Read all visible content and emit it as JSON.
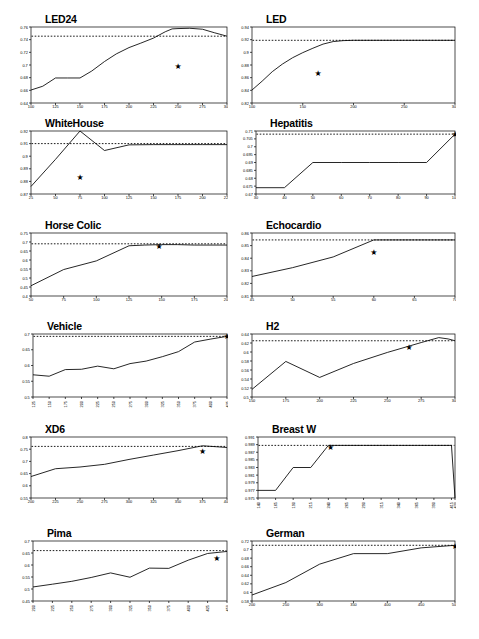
{
  "figure": {
    "name": "learning-curves-figure",
    "panel_count": 12,
    "line_color": "#000000",
    "reference_color": "#000000",
    "marker_symbol": "★",
    "background": "#ffffff"
  },
  "chart_data": [
    {
      "type": "line",
      "title": "LED24",
      "xlabel": "",
      "ylabel": "",
      "xlim": [
        100,
        300
      ],
      "ylim": [
        0.64,
        0.76
      ],
      "grid": false,
      "legend": "none",
      "xticks": [
        100,
        125,
        150,
        175,
        200,
        225,
        250,
        275,
        300
      ],
      "yticks": [
        0.64,
        0.66,
        0.68,
        0.7,
        0.72,
        0.74,
        0.76
      ],
      "x": [
        100,
        112,
        125,
        137,
        150,
        162,
        175,
        187,
        200,
        212,
        225,
        237,
        244,
        250,
        262,
        275,
        287,
        300
      ],
      "values": [
        0.6605,
        0.6665,
        0.6795,
        0.6795,
        0.6795,
        0.6905,
        0.7055,
        0.7175,
        0.7275,
        0.7345,
        0.7425,
        0.7525,
        0.757,
        0.7575,
        0.758,
        0.7565,
        0.751,
        0.7455
      ],
      "reference_line": 0.7455,
      "annotation": {
        "symbol": "★",
        "x": 250,
        "y": 0.6975
      }
    },
    {
      "type": "line",
      "title": "LED",
      "xlabel": "",
      "ylabel": "",
      "xlim": [
        100,
        300
      ],
      "ylim": [
        0.82,
        0.94
      ],
      "grid": false,
      "legend": "none",
      "xticks": [
        100,
        150,
        200,
        250,
        300
      ],
      "yticks": [
        0.82,
        0.84,
        0.86,
        0.88,
        0.9,
        0.92,
        0.94
      ],
      "x": [
        100,
        110,
        120,
        130,
        140,
        150,
        160,
        170,
        180,
        190,
        200,
        225,
        250,
        275,
        300
      ],
      "values": [
        0.8405,
        0.8545,
        0.8695,
        0.8815,
        0.8915,
        0.8995,
        0.9065,
        0.913,
        0.917,
        0.9185,
        0.919,
        0.919,
        0.919,
        0.919,
        0.919
      ],
      "reference_line": 0.919,
      "annotation": {
        "symbol": "★",
        "x": 165,
        "y": 0.866
      }
    },
    {
      "type": "line",
      "title": "WhiteHouse",
      "xlabel": "",
      "ylabel": "",
      "xlim": [
        25,
        225
      ],
      "ylim": [
        0.87,
        0.92
      ],
      "grid": false,
      "legend": "none",
      "xticks": [
        25,
        50,
        75,
        100,
        125,
        150,
        175,
        200,
        225
      ],
      "yticks": [
        0.87,
        0.88,
        0.89,
        0.9,
        0.91,
        0.92
      ],
      "x": [
        25,
        50,
        75,
        100,
        125,
        150,
        175,
        200,
        225
      ],
      "values": [
        0.876,
        0.8975,
        0.92,
        0.9045,
        0.909,
        0.9092,
        0.9092,
        0.9092,
        0.9092
      ],
      "reference_line": 0.91,
      "annotation": {
        "symbol": "★",
        "x": 75,
        "y": 0.8835
      }
    },
    {
      "type": "line",
      "title": "Hepatitis",
      "xlabel": "",
      "ylabel": "",
      "xlim": [
        30,
        100
      ],
      "ylim": [
        0.67,
        0.71
      ],
      "grid": false,
      "legend": "none",
      "xticks": [
        30,
        40,
        50,
        60,
        70,
        80,
        90,
        100
      ],
      "yticks": [
        0.67,
        0.675,
        0.68,
        0.685,
        0.69,
        0.695,
        0.7,
        0.705,
        0.71
      ],
      "x": [
        30,
        40,
        50,
        60,
        70,
        80,
        90,
        100
      ],
      "values": [
        0.674,
        0.674,
        0.69,
        0.69,
        0.69,
        0.69,
        0.69,
        0.708
      ],
      "reference_line": 0.708,
      "annotation": {
        "symbol": "★",
        "x": 100,
        "y": 0.708
      }
    },
    {
      "type": "line",
      "title": "Horse Colic",
      "xlabel": "",
      "ylabel": "",
      "xlim": [
        50,
        200
      ],
      "ylim": [
        0.4,
        0.75
      ],
      "grid": false,
      "legend": "none",
      "xticks": [
        50,
        75,
        100,
        125,
        150,
        175,
        200
      ],
      "yticks": [
        0.4,
        0.45,
        0.5,
        0.55,
        0.6,
        0.65,
        0.7,
        0.75
      ],
      "x": [
        50,
        75,
        100,
        125,
        137,
        150,
        162,
        175,
        200
      ],
      "values": [
        0.457,
        0.547,
        0.595,
        0.679,
        0.683,
        0.6855,
        0.6855,
        0.683,
        0.683
      ],
      "reference_line": 0.69,
      "annotation": {
        "symbol": "★",
        "x": 148,
        "y": 0.673
      }
    },
    {
      "type": "line",
      "title": "Echocardio",
      "xlabel": "",
      "ylabel": "",
      "xlim": [
        45,
        70
      ],
      "ylim": [
        0.81,
        0.86
      ],
      "grid": false,
      "legend": "none",
      "xticks": [
        45,
        50,
        55,
        60,
        65,
        70
      ],
      "yticks": [
        0.81,
        0.82,
        0.83,
        0.84,
        0.85,
        0.86
      ],
      "x": [
        45,
        50,
        55,
        60,
        65,
        70
      ],
      "values": [
        0.8255,
        0.8325,
        0.841,
        0.8545,
        0.8545,
        0.8545
      ],
      "reference_line": 0.8545,
      "annotation": {
        "symbol": "★",
        "x": 60,
        "y": 0.845
      }
    },
    {
      "type": "line",
      "title": "Vehicle",
      "xlabel": "",
      "ylabel": "",
      "xlim": [
        125,
        425
      ],
      "ylim": [
        0.5,
        0.7
      ],
      "grid": false,
      "legend": "none",
      "xticks": [
        125,
        150,
        175,
        200,
        225,
        250,
        275,
        300,
        325,
        350,
        375,
        400,
        425
      ],
      "yticks": [
        0.5,
        0.55,
        0.6,
        0.65,
        0.7
      ],
      "x": [
        125,
        150,
        175,
        200,
        225,
        250,
        275,
        300,
        325,
        350,
        375,
        400,
        425
      ],
      "values": [
        0.5705,
        0.566,
        0.587,
        0.588,
        0.598,
        0.5895,
        0.606,
        0.614,
        0.628,
        0.644,
        0.6745,
        0.684,
        0.6925
      ],
      "reference_line": 0.6925,
      "annotation": {
        "symbol": "★",
        "x": 425,
        "y": 0.6925
      }
    },
    {
      "type": "line",
      "title": "H2",
      "xlabel": "",
      "ylabel": "",
      "xlim": [
        150,
        300
      ],
      "ylim": [
        0.5,
        0.64
      ],
      "grid": false,
      "legend": "none",
      "xticks": [
        150,
        175,
        200,
        225,
        250,
        275,
        300
      ],
      "yticks": [
        0.5,
        0.52,
        0.54,
        0.56,
        0.58,
        0.6,
        0.62,
        0.64
      ],
      "x": [
        150,
        175,
        200,
        225,
        250,
        275,
        288,
        295,
        300
      ],
      "values": [
        0.517,
        0.579,
        0.5435,
        0.5745,
        0.599,
        0.621,
        0.632,
        0.629,
        0.625
      ],
      "reference_line": 0.625,
      "annotation": {
        "symbol": "★",
        "x": 266,
        "y": 0.61
      }
    },
    {
      "type": "line",
      "title": "XD6",
      "xlabel": "",
      "ylabel": "",
      "xlim": [
        200,
        400
      ],
      "ylim": [
        0.55,
        0.8
      ],
      "grid": false,
      "legend": "none",
      "xticks": [
        200,
        225,
        250,
        275,
        300,
        325,
        350,
        375,
        400
      ],
      "yticks": [
        0.55,
        0.6,
        0.65,
        0.7,
        0.75,
        0.8
      ],
      "x": [
        200,
        225,
        250,
        275,
        300,
        325,
        350,
        375,
        400
      ],
      "values": [
        0.638,
        0.67,
        0.677,
        0.688,
        0.708,
        0.726,
        0.744,
        0.764,
        0.757
      ],
      "reference_line": 0.7615,
      "annotation": {
        "symbol": "★",
        "x": 375,
        "y": 0.7415
      }
    },
    {
      "type": "line",
      "title": "Breast W",
      "xlabel": "",
      "ylabel": "",
      "xlim": [
        140,
        420
      ],
      "ylim": [
        0.975,
        0.991
      ],
      "grid": false,
      "legend": "none",
      "xticks": [
        140,
        165,
        190,
        215,
        240,
        265,
        290,
        315,
        340,
        365,
        390,
        415,
        420
      ],
      "yticks": [
        0.975,
        0.977,
        0.979,
        0.981,
        0.983,
        0.985,
        0.987,
        0.989,
        0.991
      ],
      "x": [
        140,
        165,
        190,
        215,
        240,
        265,
        290,
        315,
        340,
        365,
        390,
        415,
        420
      ],
      "values": [
        0.977,
        0.977,
        0.983,
        0.983,
        0.9888,
        0.9888,
        0.9888,
        0.9888,
        0.9888,
        0.9888,
        0.9888,
        0.9888,
        0.975
      ],
      "reference_line": 0.9888,
      "annotation": {
        "symbol": "★",
        "x": 243,
        "y": 0.9884
      }
    },
    {
      "type": "line",
      "title": "Pima",
      "xlabel": "",
      "ylabel": "",
      "xlim": [
        200,
        450
      ],
      "ylim": [
        0.45,
        0.7
      ],
      "grid": false,
      "legend": "none",
      "xticks": [
        200,
        225,
        250,
        275,
        300,
        325,
        350,
        375,
        400,
        425,
        450
      ],
      "yticks": [
        0.45,
        0.5,
        0.55,
        0.6,
        0.65,
        0.7
      ],
      "x": [
        200,
        225,
        250,
        275,
        300,
        325,
        350,
        375,
        400,
        425,
        450
      ],
      "values": [
        0.5085,
        0.52,
        0.532,
        0.548,
        0.567,
        0.549,
        0.587,
        0.586,
        0.62,
        0.648,
        0.6565
      ],
      "reference_line": 0.66,
      "annotation": {
        "symbol": "★",
        "x": 437,
        "y": 0.629
      }
    },
    {
      "type": "line",
      "title": "German",
      "xlabel": "",
      "ylabel": "",
      "xlim": [
        200,
        500
      ],
      "ylim": [
        0.58,
        0.72
      ],
      "grid": false,
      "legend": "none",
      "xticks": [
        200,
        250,
        300,
        350,
        400,
        450,
        500
      ],
      "yticks": [
        0.58,
        0.6,
        0.62,
        0.64,
        0.66,
        0.68,
        0.7,
        0.72
      ],
      "x": [
        200,
        250,
        300,
        350,
        400,
        450,
        500
      ],
      "values": [
        0.594,
        0.623,
        0.666,
        0.6905,
        0.6905,
        0.704,
        0.71
      ],
      "reference_line": 0.71,
      "annotation": {
        "symbol": "★",
        "x": 500,
        "y": 0.708
      }
    }
  ],
  "layout": {
    "panels": [
      {
        "col": 0,
        "row": 0,
        "x": 31,
        "y": 27,
        "w": 196,
        "h": 76,
        "rot_xticks": false,
        "title_dx": 14,
        "title_dy": -2
      },
      {
        "col": 1,
        "row": 0,
        "x": 252,
        "y": 27,
        "w": 203,
        "h": 76,
        "rot_xticks": false,
        "title_dx": 14,
        "title_dy": -2
      },
      {
        "col": 0,
        "row": 1,
        "x": 31,
        "y": 131,
        "w": 196,
        "h": 63,
        "rot_xticks": false,
        "title_dx": 14,
        "title_dy": -2
      },
      {
        "col": 1,
        "row": 1,
        "x": 256,
        "y": 131,
        "w": 199,
        "h": 63,
        "rot_xticks": false,
        "title_dx": 14,
        "title_dy": -2
      },
      {
        "col": 0,
        "row": 2,
        "x": 31,
        "y": 233,
        "w": 196,
        "h": 63,
        "rot_xticks": false,
        "title_dx": 14,
        "title_dy": -2
      },
      {
        "col": 1,
        "row": 2,
        "x": 252,
        "y": 233,
        "w": 203,
        "h": 63,
        "rot_xticks": false,
        "title_dx": 14,
        "title_dy": -2
      },
      {
        "col": 0,
        "row": 3,
        "x": 33,
        "y": 334,
        "w": 194,
        "h": 63,
        "rot_xticks": true,
        "title_dx": 14,
        "title_dy": -2
      },
      {
        "col": 1,
        "row": 3,
        "x": 252,
        "y": 334,
        "w": 203,
        "h": 63,
        "rot_xticks": false,
        "title_dx": 14,
        "title_dy": -2
      },
      {
        "col": 0,
        "row": 4,
        "x": 31,
        "y": 437,
        "w": 196,
        "h": 61,
        "rot_xticks": false,
        "title_dx": 14,
        "title_dy": -2
      },
      {
        "col": 1,
        "row": 4,
        "x": 258,
        "y": 437,
        "w": 197,
        "h": 61,
        "rot_xticks": true,
        "title_dx": 14,
        "title_dy": -2
      },
      {
        "col": 0,
        "row": 5,
        "x": 33,
        "y": 541,
        "w": 194,
        "h": 60,
        "rot_xticks": true,
        "title_dx": 14,
        "title_dy": -2
      },
      {
        "col": 1,
        "row": 5,
        "x": 252,
        "y": 541,
        "w": 203,
        "h": 60,
        "rot_xticks": false,
        "title_dx": 14,
        "title_dy": -2
      }
    ]
  }
}
